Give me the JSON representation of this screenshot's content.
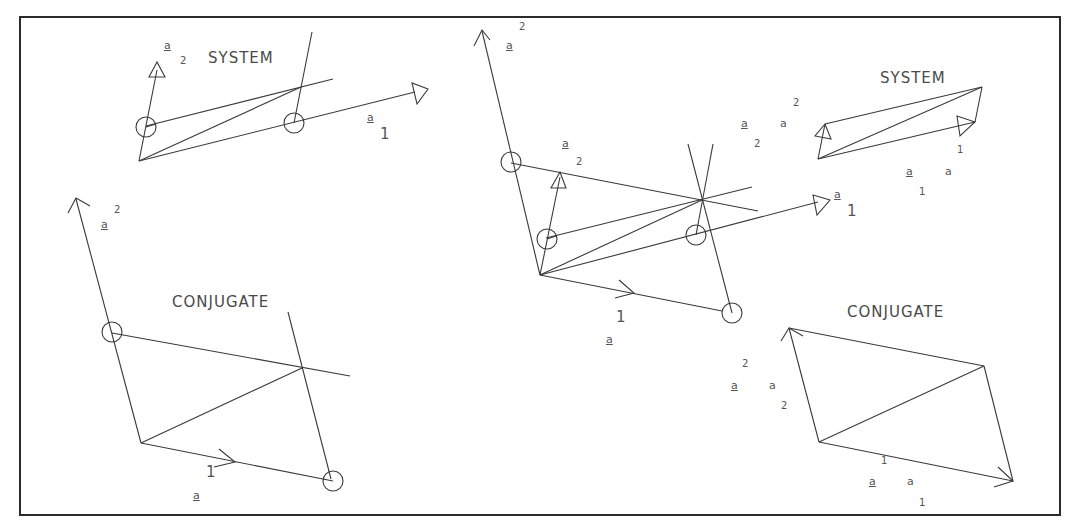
{
  "figure": {
    "panels": {
      "top_left": {
        "title": "SYSTEM",
        "labels": {
          "a2_vec": "a",
          "a2_sub": "2",
          "a1_vec": "a",
          "a1_sub": "1"
        }
      },
      "bottom_left": {
        "title": "CONJUGATE",
        "labels": {
          "a2_vec": "a",
          "a2_sup": "2",
          "a1_vec": "a",
          "a1_sup": "1"
        }
      },
      "center": {
        "labels": {
          "a2_sup_vec": "a",
          "a2_sup": "2",
          "a2_sub_vec": "a",
          "a2_sub": "2",
          "a1_sub_vec": "a",
          "a1_sub": "1",
          "a1_sup_vec": "a",
          "a1_sup": "1"
        }
      },
      "top_right": {
        "title": "SYSTEM",
        "labels": {
          "a2_vec": "a",
          "a2_sub": "2",
          "a2_scalar": "a",
          "a2_sup": "2",
          "a1_sub_tip": "1",
          "a1_vec": "a",
          "a1_sub": "1",
          "a1_scalar": "a"
        }
      },
      "bottom_right": {
        "title": "CONJUGATE",
        "labels": {
          "a2_sup": "2",
          "a2_vec": "a",
          "a2_scalar": "a",
          "a2_sub": "2",
          "a1_sup_mid": "1",
          "a1_vec": "a",
          "a1_scalar": "a",
          "a1_sub": "1"
        }
      }
    },
    "colors": {
      "line": "#3a3a3a",
      "frame": "#2b2b2b",
      "text": "#555555",
      "background": "#ffffff"
    }
  }
}
